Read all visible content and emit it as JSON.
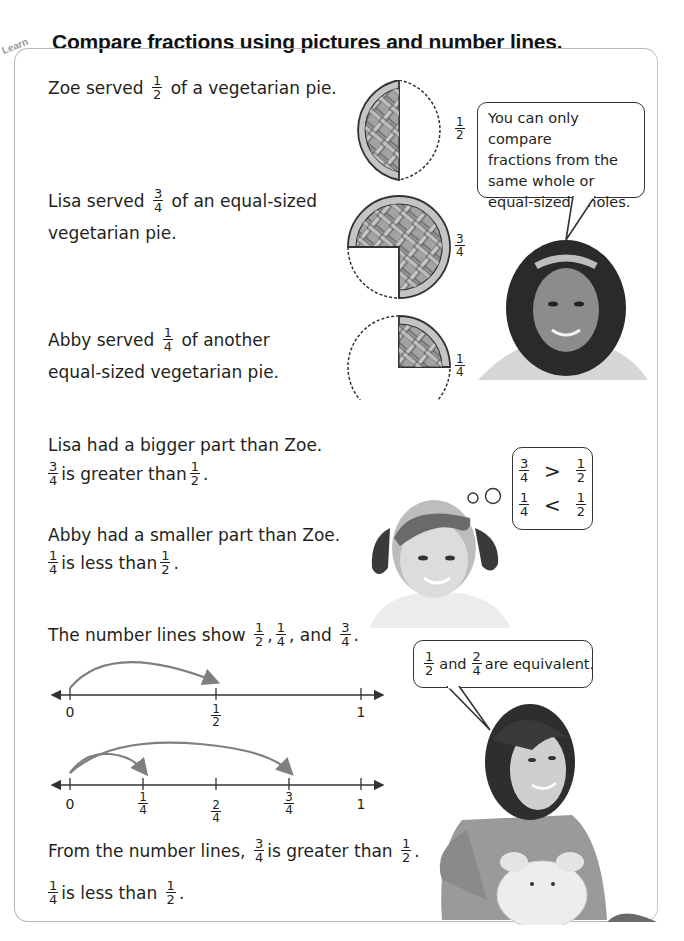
{
  "header": {
    "tag": "Learn",
    "title": "Compare fractions using pictures and number lines."
  },
  "pies": [
    {
      "person": "Zoe",
      "text_before": "Zoe served",
      "numerator": "1",
      "denominator": "2",
      "text_after": "of a vegetarian pie.",
      "line2": "",
      "label_num": "1",
      "label_den": "2"
    },
    {
      "person": "Lisa",
      "text_before": "Lisa served",
      "numerator": "3",
      "denominator": "4",
      "text_after": "of an equal-sized",
      "line2": "vegetarian pie.",
      "label_num": "3",
      "label_den": "4"
    },
    {
      "person": "Abby",
      "text_before": "Abby served",
      "numerator": "1",
      "denominator": "4",
      "text_after": "of another",
      "line2": "equal-sized vegetarian pie.",
      "label_num": "1",
      "label_den": "4"
    }
  ],
  "speech_bubble_1": {
    "lines": [
      "You can only compare",
      "fractions from the",
      "same whole or",
      "equal-sized wholes."
    ]
  },
  "comparisons": {
    "lisa_line": "Lisa had a bigger part than Zoe.",
    "lisa_frac_a": {
      "n": "3",
      "d": "4"
    },
    "lisa_mid": "is greater than",
    "lisa_frac_b": {
      "n": "1",
      "d": "2"
    },
    "abby_line": "Abby had a smaller part than Zoe.",
    "abby_frac_a": {
      "n": "1",
      "d": "4"
    },
    "abby_mid": "is less than",
    "abby_frac_b": {
      "n": "1",
      "d": "2"
    },
    "period": "."
  },
  "thought_bubble": {
    "row1": {
      "a_n": "3",
      "a_d": "4",
      "op": ">",
      "b_n": "1",
      "b_d": "2"
    },
    "row2": {
      "a_n": "1",
      "a_d": "4",
      "op": "<",
      "b_n": "1",
      "b_d": "2"
    }
  },
  "number_lines": {
    "intro_text": "The number lines show",
    "intro_fracs": [
      {
        "n": "1",
        "d": "2"
      },
      {
        "n": "1",
        "d": "4"
      },
      {
        "n": "3",
        "d": "4"
      }
    ],
    "sep1": ",",
    "sep2": ", and",
    "period": ".",
    "line1": {
      "ticks": [
        {
          "label": "0"
        },
        {
          "n": "1",
          "d": "2"
        },
        {
          "label": "1"
        }
      ]
    },
    "line2": {
      "ticks": [
        {
          "label": "0"
        },
        {
          "n": "1",
          "d": "4"
        },
        {
          "n": "2",
          "d": "4"
        },
        {
          "n": "3",
          "d": "4"
        },
        {
          "label": "1"
        }
      ]
    },
    "conclusion1_before": "From the number lines,",
    "conclusion1_a": {
      "n": "3",
      "d": "4"
    },
    "conclusion1_mid": "is greater than",
    "conclusion1_b": {
      "n": "1",
      "d": "2"
    },
    "conclusion2_a": {
      "n": "1",
      "d": "4"
    },
    "conclusion2_mid": "is less than",
    "conclusion2_b": {
      "n": "1",
      "d": "2"
    }
  },
  "speech_bubble_2": {
    "a": {
      "n": "1",
      "d": "2"
    },
    "and": "and",
    "b": {
      "n": "2",
      "d": "4"
    },
    "rest": "are equivalent."
  },
  "colors": {
    "pie_fill": "#9a9a9a",
    "pie_crust": "#c4c4c4",
    "outline": "#333333",
    "arrow": "#7f7f7f",
    "panel_border": "#b8b8b8"
  }
}
